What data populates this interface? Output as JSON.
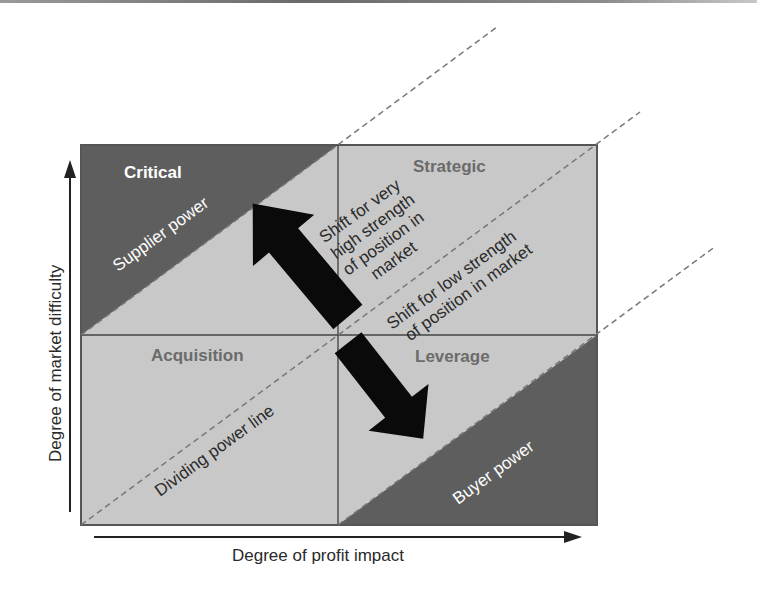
{
  "diagram": {
    "type": "purchasing-portfolio-matrix",
    "colors": {
      "light_fill": "#c8c8c8",
      "dark_fill": "#5e5e5e",
      "border": "#555555",
      "dashed_line": "#777777",
      "quadrant_title_dark": "#ffffff",
      "quadrant_title_light": "#6b6b6b",
      "arrow": "#0a0a0a",
      "text": "#2a2a2a"
    },
    "axes": {
      "x_label": "Degree of profit impact",
      "y_label": "Degree of market difficulty"
    },
    "quadrants": {
      "top_left": "Critical",
      "top_right": "Strategic",
      "bottom_left": "Acquisition",
      "bottom_right": "Leverage"
    },
    "regions": {
      "supplier": "Supplier power",
      "buyer": "Buyer power",
      "dividing": "Dividing power line"
    },
    "shifts": {
      "up": {
        "line1": "Shift for very",
        "line2": "high strength",
        "line3": "of position in",
        "line4": "market"
      },
      "down": {
        "line1": "Shift for low strength",
        "line2": "of position in market"
      }
    }
  }
}
